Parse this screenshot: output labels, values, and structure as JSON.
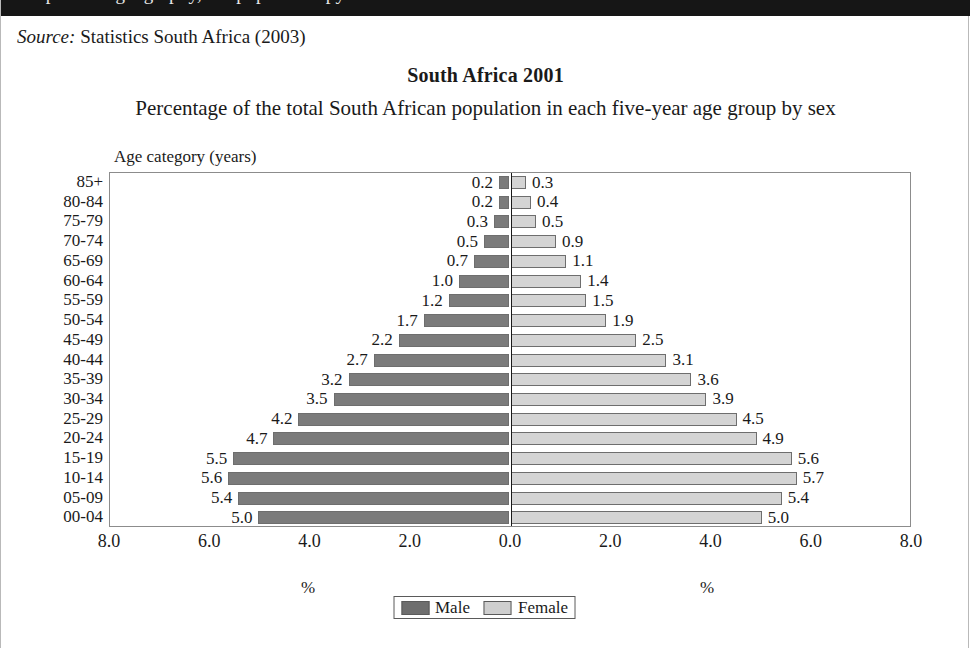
{
  "header_band": {
    "clipped_text": "Population geography, the population pyramid"
  },
  "source": {
    "keyword": "Source:",
    "text": " Statistics South Africa (2003)"
  },
  "titles": {
    "main": "South Africa 2001",
    "subtitle": "Percentage of the total South African population in each five-year age group by sex"
  },
  "axis_caption_y": "Age category (years)",
  "pct_label_left": "%",
  "pct_label_right": "%",
  "legend": {
    "male_label": "Male",
    "female_label": "Female",
    "male_color": "#6e6e6e",
    "female_color": "#cfcfcf"
  },
  "chart_data": {
    "type": "bar",
    "subtype": "population-pyramid",
    "title": "South Africa 2001",
    "subtitle": "Percentage of the total South African population in each five-year age group by sex",
    "xlabel": "%",
    "ylabel": "Age category (years)",
    "xlim": [
      -8.0,
      8.0
    ],
    "xticks": [
      "8.0",
      "6.0",
      "4.0",
      "2.0",
      "0.0",
      "2.0",
      "4.0",
      "6.0",
      "8.0"
    ],
    "xtick_values": [
      -8.0,
      -6.0,
      -4.0,
      -2.0,
      0.0,
      2.0,
      4.0,
      6.0,
      8.0
    ],
    "grid": false,
    "legend_position": "bottom-center",
    "categories": [
      "85+",
      "80-84",
      "75-79",
      "70-74",
      "65-69",
      "60-64",
      "55-59",
      "50-54",
      "45-49",
      "40-44",
      "35-39",
      "30-34",
      "25-29",
      "20-24",
      "15-19",
      "10-14",
      "05-09",
      "00-04"
    ],
    "series": [
      {
        "name": "Male",
        "color": "#7b7b7b",
        "values": [
          0.2,
          0.2,
          0.3,
          0.5,
          0.7,
          1.0,
          1.2,
          1.7,
          2.2,
          2.7,
          3.2,
          3.5,
          4.2,
          4.7,
          5.5,
          5.6,
          5.4,
          5.0
        ],
        "labels": [
          "0.2",
          "0.2",
          "0.3",
          "0.5",
          "0.7",
          "1.0",
          "1.2",
          "1.7",
          "2.2",
          "2.7",
          "3.2",
          "3.5",
          "4.2",
          "4.7",
          "5.5",
          "5.6",
          "5.4",
          "5.0"
        ]
      },
      {
        "name": "Female",
        "color": "#d4d4d4",
        "values": [
          0.3,
          0.4,
          0.5,
          0.9,
          1.1,
          1.4,
          1.5,
          1.9,
          2.5,
          3.1,
          3.6,
          3.9,
          4.5,
          4.9,
          5.6,
          5.7,
          5.4,
          5.0
        ],
        "labels": [
          "0.3",
          "0.4",
          "0.5",
          "0.9",
          "1.1",
          "1.4",
          "1.5",
          "1.9",
          "2.5",
          "3.1",
          "3.6",
          "3.9",
          "4.5",
          "4.9",
          "5.6",
          "5.7",
          "5.4",
          "5.0"
        ]
      }
    ]
  }
}
